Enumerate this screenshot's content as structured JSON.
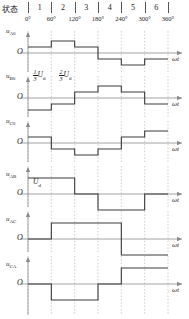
{
  "header": {
    "state_label": "状态",
    "states": [
      "1",
      "2",
      "3",
      "4",
      "5",
      "6"
    ],
    "angles": [
      "0°",
      "60°",
      "120°",
      "180°",
      "240°",
      "300°",
      "360°"
    ]
  },
  "axis": {
    "origin_label": "O",
    "time_label": "ωt",
    "angle_min": 0,
    "angle_max": 360,
    "gridlines_deg": [
      0,
      60,
      120,
      180,
      240,
      300,
      360
    ]
  },
  "annotations": {
    "one_third_ud": {
      "numerator": "1",
      "denominator": "3",
      "symbol": "U",
      "sub": "d"
    },
    "two_third_ud": {
      "numerator": "2",
      "denominator": "3",
      "symbol": "U",
      "sub": "d"
    },
    "ud": {
      "symbol": "U",
      "sub": "d"
    }
  },
  "colors": {
    "waveform": "#3a3a3a",
    "axis": "#8a8a8a",
    "grid": "#b9b9b9",
    "text": "#1a1a1a"
  },
  "chart_data": {
    "type": "line",
    "xlabel": "ωt",
    "ylabel": "voltage",
    "xlim": [
      0,
      360
    ],
    "x_tick_labels": [
      "0°",
      "60°",
      "120°",
      "180°",
      "240°",
      "300°",
      "360°"
    ],
    "x_ticks": [
      0,
      60,
      120,
      180,
      240,
      300,
      360
    ],
    "grid": true,
    "legend": "none",
    "series": [
      {
        "name": "u_A0",
        "label": "u",
        "sub": "A0",
        "ylim": [
          -0.8,
          0.8
        ],
        "unit": "U_d",
        "steps": [
          {
            "from": 0,
            "to": 60,
            "value": 0.3333
          },
          {
            "from": 60,
            "to": 120,
            "value": 0.6667
          },
          {
            "from": 120,
            "to": 180,
            "value": 0.3333
          },
          {
            "from": 180,
            "to": 240,
            "value": -0.3333
          },
          {
            "from": 240,
            "to": 300,
            "value": -0.6667
          },
          {
            "from": 300,
            "to": 360,
            "value": -0.3333
          }
        ]
      },
      {
        "name": "u_B0",
        "label": "u",
        "sub": "B0",
        "ylim": [
          -0.8,
          0.8
        ],
        "unit": "U_d",
        "steps": [
          {
            "from": 0,
            "to": 60,
            "value": -0.6667
          },
          {
            "from": 60,
            "to": 120,
            "value": -0.3333
          },
          {
            "from": 120,
            "to": 180,
            "value": 0.3333
          },
          {
            "from": 180,
            "to": 240,
            "value": 0.6667
          },
          {
            "from": 240,
            "to": 300,
            "value": 0.3333
          },
          {
            "from": 300,
            "to": 360,
            "value": -0.3333
          }
        ]
      },
      {
        "name": "u_C0",
        "label": "u",
        "sub": "C0",
        "ylim": [
          -0.8,
          0.8
        ],
        "unit": "U_d",
        "steps": [
          {
            "from": 0,
            "to": 60,
            "value": 0.3333
          },
          {
            "from": 60,
            "to": 120,
            "value": -0.3333
          },
          {
            "from": 120,
            "to": 180,
            "value": -0.6667
          },
          {
            "from": 180,
            "to": 240,
            "value": -0.3333
          },
          {
            "from": 240,
            "to": 300,
            "value": 0.3333
          },
          {
            "from": 300,
            "to": 360,
            "value": 0.6667
          }
        ]
      },
      {
        "name": "u_AB",
        "label": "u",
        "sub": "AB",
        "ylim": [
          -1.3,
          1.3
        ],
        "unit": "U_d",
        "steps": [
          {
            "from": 0,
            "to": 120,
            "value": 1
          },
          {
            "from": 120,
            "to": 180,
            "value": 0
          },
          {
            "from": 180,
            "to": 300,
            "value": -1
          },
          {
            "from": 300,
            "to": 360,
            "value": 0
          }
        ]
      },
      {
        "name": "u_AC",
        "label": "u",
        "sub": "AC",
        "ylim": [
          -1.3,
          1.3
        ],
        "unit": "U_d",
        "steps": [
          {
            "from": 0,
            "to": 60,
            "value": 0
          },
          {
            "from": 60,
            "to": 240,
            "value": 1
          },
          {
            "from": 240,
            "to": 360,
            "value": -1
          }
        ]
      },
      {
        "name": "u_CA",
        "label": "u",
        "sub": "CA",
        "ylim": [
          -1.3,
          1.3
        ],
        "unit": "U_d",
        "steps": [
          {
            "from": 0,
            "to": 60,
            "value": 0
          },
          {
            "from": 60,
            "to": 180,
            "value": -1
          },
          {
            "from": 180,
            "to": 240,
            "value": 0
          },
          {
            "from": 240,
            "to": 360,
            "value": 1
          }
        ]
      }
    ]
  }
}
